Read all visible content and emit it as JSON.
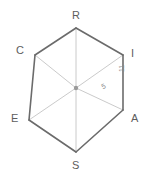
{
  "figure": {
    "type": "geometry-diagram",
    "shape_name": "regular-hexagon",
    "background_color": "#ffffff",
    "outline_color": "#6b6b6b",
    "radii_color": "#bcbcbc",
    "center_dot_color": "#9a9a9a",
    "label_color": "#5d5d5d",
    "measure_color": "#8a8a8a",
    "vertices": [
      {
        "name": "R",
        "label": "R",
        "x": 76,
        "y": 28,
        "label_x": 72,
        "label_y": 10
      },
      {
        "name": "I",
        "label": "I",
        "x": 123,
        "y": 55,
        "label_x": 131,
        "label_y": 48
      },
      {
        "name": "A",
        "label": "A",
        "x": 123,
        "y": 110,
        "label_x": 131,
        "label_y": 113
      },
      {
        "name": "S",
        "label": "S",
        "x": 76,
        "y": 152,
        "label_x": 72,
        "label_y": 160
      },
      {
        "name": "E",
        "label": "E",
        "x": 29,
        "y": 120,
        "label_x": 11,
        "label_y": 113
      },
      {
        "name": "C",
        "label": "C",
        "x": 35,
        "y": 55,
        "label_x": 16,
        "label_y": 45
      }
    ],
    "center": {
      "name": "center",
      "x": 76,
      "y": 88
    },
    "measures": [
      {
        "name": "radius-to-I",
        "value": "5",
        "x": 100,
        "y": 84,
        "orientation": "rotated"
      },
      {
        "name": "side-IA",
        "value": "11",
        "x": 118,
        "y": 72,
        "orientation": "vertical"
      }
    ],
    "edges": [
      {
        "from": "R",
        "to": "I"
      },
      {
        "from": "I",
        "to": "A"
      },
      {
        "from": "A",
        "to": "S"
      },
      {
        "from": "S",
        "to": "E"
      },
      {
        "from": "E",
        "to": "C"
      },
      {
        "from": "C",
        "to": "R"
      }
    ],
    "radii": [
      {
        "from": "center",
        "to": "R"
      },
      {
        "from": "center",
        "to": "I"
      },
      {
        "from": "center",
        "to": "A"
      },
      {
        "from": "center",
        "to": "S"
      },
      {
        "from": "center",
        "to": "E"
      },
      {
        "from": "center",
        "to": "C"
      }
    ]
  }
}
